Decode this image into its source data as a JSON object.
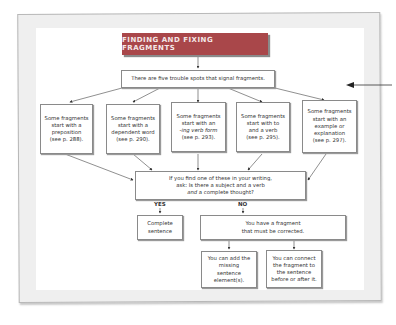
{
  "title": "FINDING AND FIXING FRAGMENTS",
  "top_box": "There are five trouble spots that signal fragments.",
  "trouble_spots": [
    {
      "line1": "Some fragments",
      "line2": "start with a",
      "line3": "preposition",
      "ref": "(see p. 288)."
    },
    {
      "line1": "Some fragments",
      "line2": "start with a",
      "line3": "dependent word",
      "ref": "(see p. 290)."
    },
    {
      "line1": "Some fragments",
      "line2": "start with an",
      "line3": "-ing verb form",
      "ref": "(see p. 293)."
    },
    {
      "line1": "Some fragments",
      "line2": "start with to",
      "line3": "and a verb",
      "ref": "(see p. 295)."
    },
    {
      "line1": "Some fragments",
      "line2": "start with an",
      "line3": "example or explanation",
      "ref": "(see p. 297)."
    }
  ],
  "question": {
    "line1": "If you find one of these in your writing,",
    "line2": "ask: Is there a subject and a verb",
    "line3_em": "and",
    "line3_rest": " a complete thought?"
  },
  "branches": {
    "yes": "YES",
    "no": "NO"
  },
  "yes_result": "Complete sentence",
  "no_result": "You have a fragment that must be corrected.",
  "fixes": [
    "You can add the missing sentence element(s).",
    "You can connect the fragment to the sentence before or after it."
  ],
  "colors": {
    "title_bg": "#a9474a",
    "frame_bg": "#efefef",
    "border": "#8a8a8a"
  }
}
